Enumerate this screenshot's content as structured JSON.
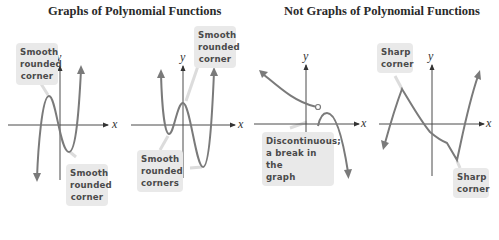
{
  "headings": {
    "left": "Graphs of Polynomial Functions",
    "right": "Not Graphs of Polynomial Functions"
  },
  "graphs": [
    {
      "id": "polynomial-cubic",
      "category": "polynomial",
      "axis_labels": {
        "x": "x",
        "y": "y"
      },
      "callouts": [
        {
          "text": "Smooth\nrounded\ncorner"
        },
        {
          "text": "Smooth\nrounded\ncorner"
        }
      ]
    },
    {
      "id": "polynomial-quartic",
      "category": "polynomial",
      "axis_labels": {
        "x": "x",
        "y": "y"
      },
      "callouts": [
        {
          "text": "Smooth\nrounded\ncorner"
        },
        {
          "text": "Smooth\nrounded\ncorners"
        }
      ]
    },
    {
      "id": "not-polynomial-discontinuous",
      "category": "not-polynomial",
      "axis_labels": {
        "x": "x",
        "y": "y"
      },
      "callouts": [
        {
          "text": "Discontinuous;\na break in the\ngraph"
        }
      ]
    },
    {
      "id": "not-polynomial-sharp-corners",
      "category": "not-polynomial",
      "axis_labels": {
        "x": "x",
        "y": "y"
      },
      "callouts": [
        {
          "text": "Sharp\ncorner"
        },
        {
          "text": "Sharp\ncorner"
        }
      ]
    }
  ],
  "colors": {
    "curve": "#7a7a7a",
    "axis": "#4a4a4a",
    "callout_bg": "#e9e9e9",
    "callout_text": "#4a4a4a",
    "heading": "#2a2a2a"
  }
}
